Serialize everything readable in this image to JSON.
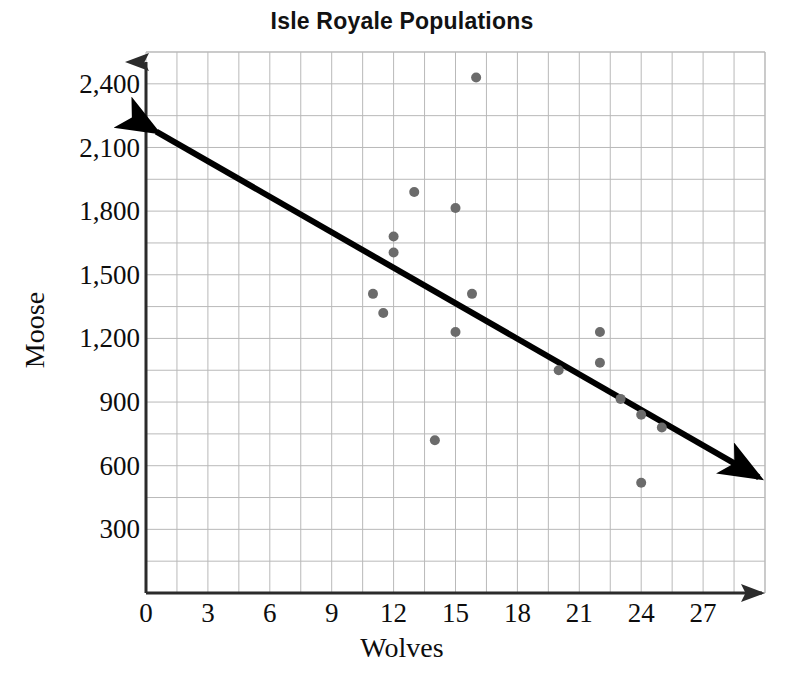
{
  "chart_data": {
    "type": "scatter",
    "title": "Isle Royale Populations",
    "xlabel": "Wolves",
    "ylabel": "Moose",
    "xlim": [
      0,
      30
    ],
    "ylim": [
      0,
      2550
    ],
    "x_ticks": [
      0,
      3,
      6,
      9,
      12,
      15,
      18,
      21,
      24,
      27
    ],
    "x_tick_labels": [
      "0",
      "3",
      "6",
      "9",
      "12",
      "15",
      "18",
      "21",
      "24",
      "27"
    ],
    "y_ticks": [
      300,
      600,
      900,
      1200,
      1500,
      1800,
      2100,
      2400
    ],
    "y_tick_labels": [
      "300",
      "600",
      "900",
      "1,200",
      "1,500",
      "1,800",
      "2,100",
      "2,400"
    ],
    "x_minor_step": 1.5,
    "y_minor_step": 150,
    "grid": true,
    "legend": "none",
    "point_color": "#6b6b6b",
    "point_radius": 5,
    "grid_color": "#b9b9b9",
    "axis_color": "#2b2b2b",
    "trendline_color": "#000000",
    "points": [
      {
        "x": 11.0,
        "y": 1410
      },
      {
        "x": 11.5,
        "y": 1320
      },
      {
        "x": 12.0,
        "y": 1680
      },
      {
        "x": 12.0,
        "y": 1605
      },
      {
        "x": 13.0,
        "y": 1890
      },
      {
        "x": 14.0,
        "y": 720
      },
      {
        "x": 15.0,
        "y": 1230
      },
      {
        "x": 15.0,
        "y": 1815
      },
      {
        "x": 15.8,
        "y": 1410
      },
      {
        "x": 16.0,
        "y": 2430
      },
      {
        "x": 20.0,
        "y": 1050
      },
      {
        "x": 22.0,
        "y": 1230
      },
      {
        "x": 22.0,
        "y": 1085
      },
      {
        "x": 23.0,
        "y": 915
      },
      {
        "x": 24.0,
        "y": 840
      },
      {
        "x": 24.0,
        "y": 520
      },
      {
        "x": 25.0,
        "y": 780
      }
    ],
    "trendline": {
      "label": "line of best fit",
      "x_start": 0.5,
      "y_start": 2175,
      "x_end": 29.7,
      "y_end": 545,
      "arrow_start": true,
      "arrow_end": true
    },
    "annotations": []
  }
}
